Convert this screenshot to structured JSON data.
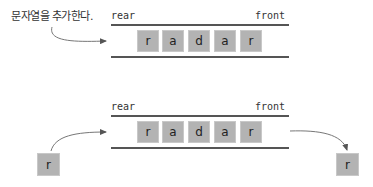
{
  "caption": "문자열을 추가한다.",
  "top_queue": {
    "rear_label": "rear",
    "front_label": "front",
    "cells": [
      "r",
      "a",
      "d",
      "a",
      "r"
    ]
  },
  "bottom_queue": {
    "rear_label": "rear",
    "front_label": "front",
    "cells": [
      "r",
      "a",
      "d",
      "a",
      "r"
    ],
    "incoming": "r",
    "outgoing": "r"
  },
  "colors": {
    "cell_fill": "#b3b3b3",
    "line": "#555555",
    "arrow": "#666666"
  }
}
